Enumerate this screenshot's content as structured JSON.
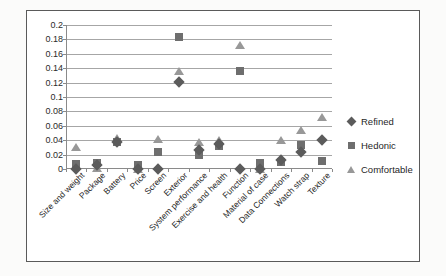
{
  "chart_data": {
    "type": "scatter",
    "title": "",
    "xlabel": "",
    "ylabel": "",
    "ylim": [
      0,
      0.2
    ],
    "ytick_step": 0.02,
    "grid": true,
    "legend_position": "right",
    "ytick_labels": [
      "0.2",
      "0.18",
      "0.16",
      "0.14",
      "0.12",
      "0.1",
      "0.08",
      "0.06",
      "0.04",
      "0.02",
      "0"
    ],
    "ytick_values": [
      0.2,
      0.18,
      0.16,
      0.14,
      0.12,
      0.1,
      0.08,
      0.06,
      0.04,
      0.02,
      0
    ],
    "categories": [
      "Size and weight",
      "Package",
      "Battery",
      "Price",
      "Screen",
      "Exterior",
      "System performance",
      "Exercise and health",
      "Function",
      "Material of case",
      "Data Connections",
      "Watch strap",
      "Texture"
    ],
    "series": [
      {
        "name": "Refined",
        "marker": "diamond",
        "color": "#5b5b5b",
        "values": [
          0.0,
          0.006,
          0.038,
          0.0,
          0.0,
          0.121,
          0.027,
          0.035,
          0.0,
          0.0,
          0.013,
          0.024,
          0.04
        ]
      },
      {
        "name": "Hedonic",
        "marker": "square",
        "color": "#6e6e6e",
        "values": [
          0.007,
          0.009,
          0.037,
          0.006,
          0.024,
          0.183,
          0.019,
          0.032,
          0.136,
          0.008,
          0.01,
          0.034,
          0.011
        ]
      },
      {
        "name": "Comfortable",
        "marker": "triangle",
        "color": "#989898",
        "values": [
          0.031,
          0.002,
          0.043,
          0.0,
          0.042,
          0.136,
          0.038,
          0.04,
          0.172,
          0.0,
          0.04,
          0.054,
          0.072
        ]
      }
    ]
  },
  "legend": {
    "entries": [
      {
        "label": "Refined",
        "marker": "diamond"
      },
      {
        "label": "Hedonic",
        "marker": "square"
      },
      {
        "label": "Comfortable",
        "marker": "triangle"
      }
    ]
  }
}
